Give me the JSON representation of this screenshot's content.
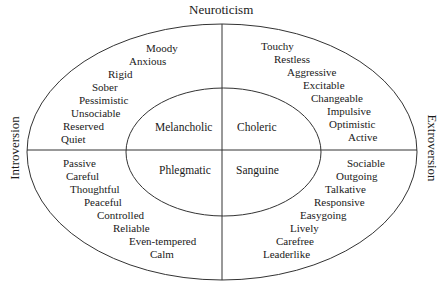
{
  "axes": {
    "top": "Neuroticism",
    "left": "Introversion",
    "right": "Extroversion"
  },
  "temperaments": {
    "top_left": "Melancholic",
    "top_right": "Choleric",
    "bottom_left": "Phlegmatic",
    "bottom_right": "Sanguine"
  },
  "traits": {
    "top_left": [
      "Moody",
      "Anxious",
      "Rigid",
      "Sober",
      "Pessimistic",
      "Unsociable",
      "Reserved",
      "Quiet"
    ],
    "top_right": [
      "Touchy",
      "Restless",
      "Aggressive",
      "Excitable",
      "Changeable",
      "Impulsive",
      "Optimistic",
      "Active"
    ],
    "bottom_left": [
      "Passive",
      "Careful",
      "Thoughtful",
      "Peaceful",
      "Controlled",
      "Reliable",
      "Even-tempered",
      "Calm"
    ],
    "bottom_right": [
      "Sociable",
      "Outgoing",
      "Talkative",
      "Responsive",
      "Easygoing",
      "Lively",
      "Carefree",
      "Leaderlike"
    ]
  },
  "colors": {
    "line": "#333333",
    "text": "#1a1a1a",
    "background": "#ffffff"
  }
}
